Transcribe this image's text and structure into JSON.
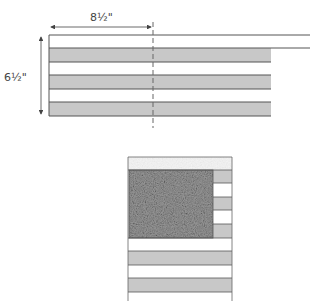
{
  "top_diagram": {
    "width_label": "8½\"",
    "height_label": "6½\"",
    "band_count": 3,
    "colors": {
      "line": "#555555",
      "band_fill": "#c8c8c8",
      "dashed_line": "#666666",
      "arrow": "#444444"
    }
  },
  "bottom_diagram": {
    "description": "stacked strip layout with textured block",
    "colors": {
      "frame": "#666666",
      "strip_gray": "#c8c8c8",
      "strip_white": "#ffffff",
      "texture_dark": "#8a8a8a",
      "texture_light": "#f2f2f2"
    }
  }
}
